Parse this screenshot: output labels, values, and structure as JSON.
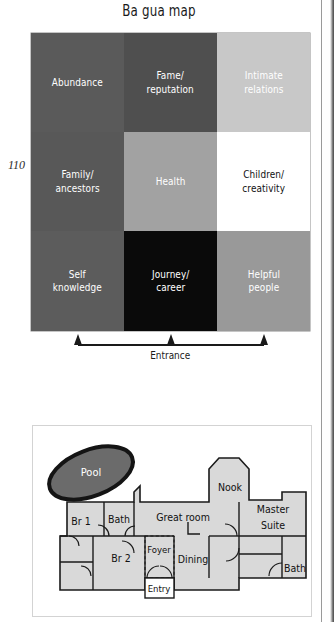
{
  "page_number": "110",
  "figure": {
    "title": "Ba gua map",
    "entrance_label": "Entrance"
  },
  "bagua": {
    "cells": [
      {
        "label": "Abundance",
        "bg": "#5a5a5a",
        "fg": "#ffffff"
      },
      {
        "label": "Fame/\nreputation",
        "bg": "#4f4f4f",
        "fg": "#ffffff"
      },
      {
        "label": "Intimate\nrelations",
        "bg": "#c8c8c8",
        "fg": "#ffffff"
      },
      {
        "label": "Family/\nancestors",
        "bg": "#585858",
        "fg": "#ffffff"
      },
      {
        "label": "Health",
        "bg": "#a2a2a2",
        "fg": "#ffffff"
      },
      {
        "label": "Children/\ncreativity",
        "bg": "#ffffff",
        "fg": "#111111"
      },
      {
        "label": "Self\nknowledge",
        "bg": "#5c5c5c",
        "fg": "#ffffff"
      },
      {
        "label": "Journey/\ncareer",
        "bg": "#0a0a0a",
        "fg": "#ffffff"
      },
      {
        "label": "Helpful\npeople",
        "bg": "#999999",
        "fg": "#ffffff"
      }
    ]
  },
  "floorplan": {
    "pool_label": "Pool",
    "rooms": [
      {
        "name": "Bath",
        "label": "Bath"
      },
      {
        "name": "Great room",
        "label": "Great room"
      },
      {
        "name": "Nook",
        "label": "Nook"
      },
      {
        "name": "Master Suite",
        "label": "Master\nSuite"
      },
      {
        "name": "Br 1",
        "label": "Br 1"
      },
      {
        "name": "Br 2",
        "label": "Br 2"
      },
      {
        "name": "Foyer",
        "label": "Foyer"
      },
      {
        "name": "Entry",
        "label": "Entry"
      },
      {
        "name": "Dining",
        "label": "Dining"
      },
      {
        "name": "Bath 2",
        "label": "Bath"
      }
    ],
    "labels": {
      "bath_top": "Bath",
      "great_room": "Great room",
      "nook": "Nook",
      "master_line1": "Master",
      "master_line2": "Suite",
      "br1": "Br 1",
      "br2": "Br 2",
      "foyer": "Foyer",
      "entry": "Entry",
      "dining": "Dining",
      "bath_right": "Bath"
    }
  },
  "colors": {
    "room_fill": "#d9d9d9",
    "room_stroke": "#1a1a1a",
    "pool_fill": "#6b6b6b",
    "pool_stroke": "#141414"
  }
}
